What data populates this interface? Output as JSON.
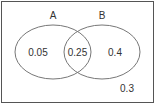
{
  "diagram": {
    "type": "venn",
    "sets": [
      {
        "name": "A",
        "label": "A"
      },
      {
        "name": "B",
        "label": "B"
      }
    ],
    "regions": {
      "a_only": "0.05",
      "a_and_b": "0.25",
      "b_only": "0.4",
      "outside": "0.3"
    },
    "colors": {
      "stroke": "#777777",
      "text": "#333333",
      "background": "#ffffff"
    }
  }
}
